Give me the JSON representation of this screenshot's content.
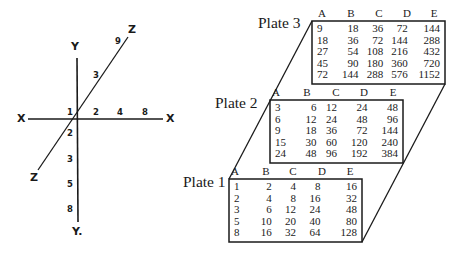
{
  "axes": {
    "x_label_left": "X",
    "x_label_right": "X",
    "y_label_top": "Y",
    "y_label_bottom": "Y.",
    "z_label_top": "Z",
    "z_label_bottom": "Z",
    "origin_tick": "1",
    "x_ticks": [
      "2",
      "4",
      "8"
    ],
    "y_ticks": [
      "2",
      "3",
      "5",
      "8"
    ],
    "z_ticks": [
      "3",
      "9"
    ]
  },
  "columns": [
    "A",
    "B",
    "C",
    "D",
    "E"
  ],
  "plates": [
    {
      "label": "Plate 1",
      "rows": [
        [
          "1",
          "2",
          "4",
          "8",
          "16"
        ],
        [
          "2",
          "4",
          "8",
          "16",
          "32"
        ],
        [
          "3",
          "6",
          "12",
          "24",
          "48"
        ],
        [
          "5",
          "10",
          "20",
          "40",
          "80"
        ],
        [
          "8",
          "16",
          "32",
          "64",
          "128"
        ]
      ]
    },
    {
      "label": "Plate 2",
      "rows": [
        [
          "3",
          "6",
          "12",
          "24",
          "48"
        ],
        [
          "6",
          "12",
          "24",
          "48",
          "96"
        ],
        [
          "9",
          "18",
          "36",
          "72",
          "144"
        ],
        [
          "15",
          "30",
          "60",
          "120",
          "240"
        ],
        [
          "24",
          "48",
          "96",
          "192",
          "384"
        ]
      ]
    },
    {
      "label": "Plate 3",
      "rows": [
        [
          "9",
          "18",
          "36",
          "72",
          "144"
        ],
        [
          "18",
          "36",
          "72",
          "144",
          "288"
        ],
        [
          "27",
          "54",
          "108",
          "216",
          "432"
        ],
        [
          "45",
          "90",
          "180",
          "360",
          "720"
        ],
        [
          "72",
          "144",
          "288",
          "576",
          "1152"
        ]
      ]
    }
  ]
}
